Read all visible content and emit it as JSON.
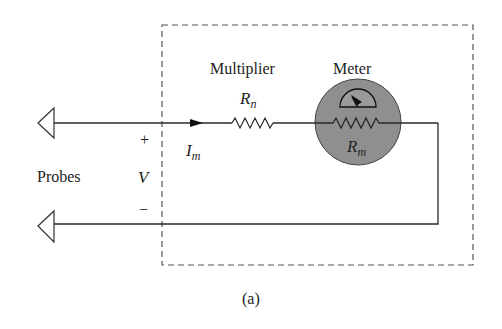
{
  "figure": {
    "caption": "(a)",
    "colors": {
      "line": "#2a2a2a",
      "dash": "#555555",
      "meter_fill": "#8f8f8f",
      "background": "#ffffff"
    }
  },
  "labels": {
    "multiplier": "Multiplier",
    "meter": "Meter",
    "probes": "Probes",
    "plus": "+",
    "minus": "−",
    "voltage": "V",
    "current_main": "I",
    "current_sub": "m",
    "rn_main": "R",
    "rn_sub": "n",
    "rm_main": "R",
    "rm_sub": "m"
  },
  "components": [
    {
      "id": "probe-top",
      "type": "probe-terminal"
    },
    {
      "id": "probe-bottom",
      "type": "probe-terminal"
    },
    {
      "id": "multiplier-resistor",
      "type": "resistor",
      "label": "Rn"
    },
    {
      "id": "meter",
      "type": "meter",
      "label": "Rm"
    },
    {
      "id": "enclosure",
      "type": "dashed-box"
    }
  ]
}
